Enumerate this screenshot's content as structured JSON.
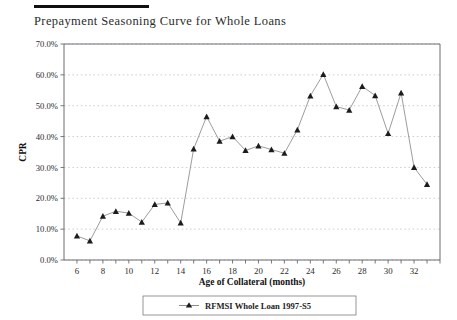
{
  "document": {
    "title": "Prepayment Seasoning Curve for Whole Loans",
    "rule_color": "#101010"
  },
  "chart_data": {
    "type": "line",
    "title": "Prepayment Seasoning Curve for Whole Loans",
    "xlabel": "Age of Collateral (months)",
    "ylabel": "CPR",
    "xlim": [
      5,
      34
    ],
    "ylim": [
      0,
      70
    ],
    "ytick_labels": [
      "0.0%",
      "10.0%",
      "20.0%",
      "30.0%",
      "40.0%",
      "50.0%",
      "60.0%",
      "70.0%"
    ],
    "ytick_values": [
      0,
      10,
      20,
      30,
      40,
      50,
      60,
      70
    ],
    "xtick_labels": [
      "6",
      "8",
      "10",
      "12",
      "14",
      "16",
      "18",
      "20",
      "22",
      "24",
      "26",
      "28",
      "30",
      "32"
    ],
    "xtick_values": [
      6,
      8,
      10,
      12,
      14,
      16,
      18,
      20,
      22,
      24,
      26,
      28,
      30,
      32
    ],
    "grid": true,
    "grid_axis": "y",
    "legend_position": "bottom",
    "marker": "triangle",
    "series": [
      {
        "name": "RFMSI Whole Loan 1997-S5",
        "x": [
          6,
          7,
          8,
          9,
          10,
          11,
          12,
          13,
          14,
          15,
          16,
          17,
          18,
          19,
          20,
          21,
          22,
          23,
          24,
          25,
          26,
          27,
          28,
          29,
          30,
          31,
          32,
          33
        ],
        "values": [
          7.8,
          6.2,
          14.2,
          15.8,
          15.2,
          12.3,
          18.0,
          18.5,
          12.0,
          36.0,
          46.5,
          38.5,
          40.0,
          35.5,
          37.0,
          35.8,
          34.6,
          42.2,
          53.2,
          60.2,
          49.7,
          48.6,
          56.3,
          53.3,
          41.0,
          54.2,
          30.0,
          24.5
        ]
      }
    ]
  },
  "legend": {
    "entries": [
      {
        "label": "RFMSI Whole Loan 1997-S5",
        "marker": "triangle",
        "color": "#1c1c1c"
      }
    ]
  },
  "colors": {
    "line": "#8a8a8f",
    "marker": "#1c1c1c",
    "grid": "#b9b9c6",
    "axis": "#6d6d72",
    "text": "#2b2b2b"
  }
}
